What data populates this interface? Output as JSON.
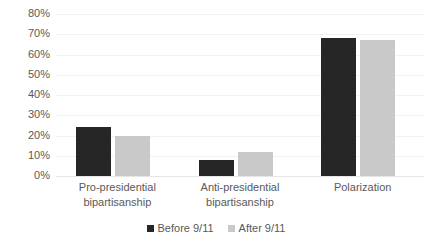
{
  "chart_data": {
    "type": "bar",
    "title": "",
    "subtitle": "",
    "xlabel": "",
    "ylabel": "",
    "categories": [
      "Pro-presidential bipartisanship",
      "Anti-presidential bipartisanship",
      "Polarization"
    ],
    "category_lines": [
      [
        "Pro-presidential",
        "bipartisanship"
      ],
      [
        "Anti-presidential",
        "bipartisanship"
      ],
      [
        "Polarization",
        ""
      ]
    ],
    "series": [
      {
        "name": "Before 9/11",
        "color": "#262626",
        "values": [
          24,
          8,
          68
        ]
      },
      {
        "name": "After 9/11",
        "color": "#c9c9c9",
        "values": [
          20,
          12,
          67
        ]
      }
    ],
    "ylim": [
      0,
      80
    ],
    "ytick_step": 10,
    "ytick_labels": [
      "80%",
      "70%",
      "60%",
      "50%",
      "40%",
      "30%",
      "20%",
      "10%",
      "0%"
    ],
    "ytick_values": [
      80,
      70,
      60,
      50,
      40,
      30,
      20,
      10,
      0
    ],
    "grid": true,
    "grid_axis": "y",
    "legend_position": "bottom-center",
    "value_suffix": "%"
  },
  "legend": {
    "items": [
      {
        "label": "Before 9/11"
      },
      {
        "label": "After 9/11"
      }
    ]
  }
}
